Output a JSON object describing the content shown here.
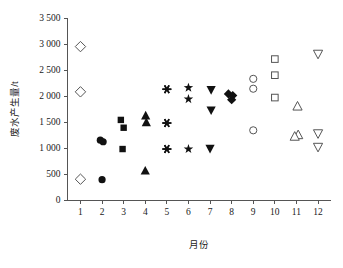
{
  "chart_data": {
    "type": "scatter",
    "title": "",
    "xlabel": "月份",
    "ylabel": "废水产生量/t",
    "xlim": [
      0.4,
      12.6
    ],
    "ylim": [
      0,
      3500
    ],
    "grid": false,
    "legend": "none",
    "x_ticks": [
      "1",
      "2",
      "3",
      "4",
      "5",
      "6",
      "7",
      "8",
      "9",
      "10",
      "11",
      "12"
    ],
    "x_tick_values": [
      1,
      2,
      3,
      4,
      5,
      6,
      7,
      8,
      9,
      10,
      11,
      12
    ],
    "y_ticks": [
      "0",
      "500",
      "1 000",
      "1 500",
      "2 000",
      "2 500",
      "3 000",
      "3 500"
    ],
    "y_tick_values": [
      0,
      500,
      1000,
      1500,
      2000,
      2500,
      3000,
      3500
    ],
    "series": [
      {
        "name": "1月",
        "marker": "open-diamond",
        "filled": false,
        "points": [
          {
            "x": 1.0,
            "y": 2950
          },
          {
            "x": 1.0,
            "y": 2080
          },
          {
            "x": 1.0,
            "y": 400
          }
        ]
      },
      {
        "name": "2月",
        "marker": "filled-circle",
        "filled": true,
        "points": [
          {
            "x": 1.92,
            "y": 1150
          },
          {
            "x": 2.05,
            "y": 1120
          },
          {
            "x": 2.0,
            "y": 390
          }
        ]
      },
      {
        "name": "3月",
        "marker": "filled-square",
        "filled": true,
        "points": [
          {
            "x": 2.87,
            "y": 1540
          },
          {
            "x": 3.0,
            "y": 1390
          },
          {
            "x": 2.95,
            "y": 980
          }
        ]
      },
      {
        "name": "4月",
        "marker": "filled-triangle-up",
        "filled": true,
        "points": [
          {
            "x": 4.02,
            "y": 1630
          },
          {
            "x": 4.05,
            "y": 1500
          },
          {
            "x": 4.0,
            "y": 570
          }
        ]
      },
      {
        "name": "5月",
        "marker": "asterisk",
        "filled": true,
        "points": [
          {
            "x": 5.0,
            "y": 2130
          },
          {
            "x": 5.0,
            "y": 1480
          },
          {
            "x": 5.0,
            "y": 980
          }
        ]
      },
      {
        "name": "6月",
        "marker": "filled-star",
        "filled": true,
        "points": [
          {
            "x": 6.0,
            "y": 2160
          },
          {
            "x": 6.0,
            "y": 1940
          },
          {
            "x": 6.0,
            "y": 980
          }
        ]
      },
      {
        "name": "7月",
        "marker": "filled-triangle-down",
        "filled": true,
        "points": [
          {
            "x": 7.05,
            "y": 2110
          },
          {
            "x": 7.05,
            "y": 1720
          },
          {
            "x": 7.0,
            "y": 980
          }
        ]
      },
      {
        "name": "8月",
        "marker": "filled-diamond",
        "filled": true,
        "points": [
          {
            "x": 7.85,
            "y": 2040
          },
          {
            "x": 8.05,
            "y": 2010
          },
          {
            "x": 8.0,
            "y": 1930
          }
        ]
      },
      {
        "name": "9月",
        "marker": "open-circle",
        "filled": false,
        "points": [
          {
            "x": 9.0,
            "y": 2330
          },
          {
            "x": 9.0,
            "y": 2140
          },
          {
            "x": 9.0,
            "y": 1340
          }
        ]
      },
      {
        "name": "10月",
        "marker": "open-square",
        "filled": false,
        "points": [
          {
            "x": 10.0,
            "y": 2710
          },
          {
            "x": 10.0,
            "y": 2400
          },
          {
            "x": 10.0,
            "y": 1970
          }
        ]
      },
      {
        "name": "11月",
        "marker": "open-triangle-up",
        "filled": false,
        "points": [
          {
            "x": 11.05,
            "y": 1810
          },
          {
            "x": 11.08,
            "y": 1260
          },
          {
            "x": 10.92,
            "y": 1230
          }
        ]
      },
      {
        "name": "12月",
        "marker": "open-triangle-down",
        "filled": false,
        "points": [
          {
            "x": 12.0,
            "y": 2800
          },
          {
            "x": 12.0,
            "y": 1270
          },
          {
            "x": 12.0,
            "y": 1010
          }
        ]
      }
    ]
  },
  "colors": {
    "marker_fill": "#111111",
    "marker_stroke": "#555555",
    "axis": "#555555",
    "text": "#1a1a1a",
    "background": "#ffffff"
  }
}
